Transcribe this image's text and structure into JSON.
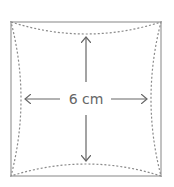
{
  "diagram": {
    "title": "",
    "label": "6 cm",
    "shape": "square with inward-curved dashed inner outline",
    "colors": {
      "square_stroke": "#9a9a9a",
      "dashed_stroke": "#8a8a8a",
      "arrow_stroke": "#666666",
      "text": "#666666"
    },
    "arrows": [
      "up",
      "down",
      "left",
      "right"
    ]
  }
}
